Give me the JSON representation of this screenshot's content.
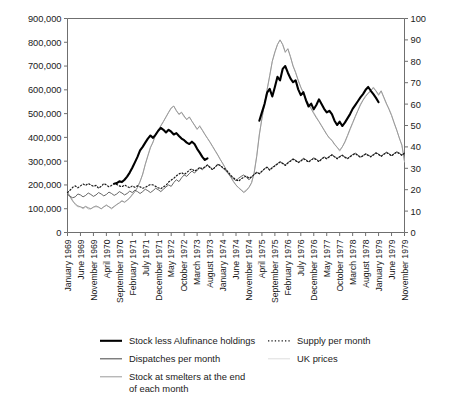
{
  "chart_data": {
    "type": "line",
    "title": "",
    "subtitle": "",
    "xlabel": "",
    "ylabel": "",
    "y2label": "",
    "grid": false,
    "legend_position": "bottom",
    "ylim": [
      0,
      900000
    ],
    "y2lim": [
      0,
      100
    ],
    "y_ticks": [
      "0",
      "100,000",
      "200,000",
      "300,000",
      "400,000",
      "500,000",
      "600,000",
      "700,000",
      "800,000",
      "900,000"
    ],
    "y_tick_values": [
      0,
      100000,
      200000,
      300000,
      400000,
      500000,
      600000,
      700000,
      800000,
      900000
    ],
    "y2_ticks": [
      "0",
      "10",
      "20",
      "30",
      "40",
      "50",
      "60",
      "70",
      "80",
      "90",
      "100"
    ],
    "y2_tick_values": [
      0,
      10,
      20,
      30,
      40,
      50,
      60,
      70,
      80,
      90,
      100
    ],
    "x_tick_labels": [
      "January 1969",
      "June 1969",
      "November 1969",
      "April 1970",
      "September 1970",
      "February 1971",
      "July 1971",
      "December 1971",
      "May 1972",
      "October 1972",
      "March 1973",
      "August 1973",
      "January 1974",
      "June 1974",
      "November 1974",
      "April 1975",
      "September 1975",
      "February 1976",
      "July 1976",
      "December 1976",
      "May 1977",
      "October 1977",
      "March 1978",
      "August 1978",
      "January 1979",
      "June 1979",
      "November 1979"
    ],
    "x_tick_month_index": [
      0,
      5,
      10,
      15,
      20,
      25,
      30,
      35,
      40,
      45,
      50,
      55,
      60,
      65,
      70,
      75,
      80,
      85,
      90,
      95,
      100,
      105,
      110,
      115,
      120,
      125,
      130
    ],
    "x_month_count": 131,
    "series": [
      {
        "name": "Stock less Alufinance holdings",
        "axis": "left",
        "color": "#000000",
        "width": 2.1,
        "dash": "none",
        "segments": [
          {
            "start_month": 18,
            "values": [
              205000,
              208000,
              215000,
              212000,
              222000,
              235000,
              252000,
              272000,
              295000,
              318000,
              345000,
              360000,
              378000,
              395000,
              408000,
              398000,
              412000,
              428000,
              440000,
              432000,
              421000,
              432000,
              424000,
              412000,
              418000,
              406000,
              395000,
              388000,
              378000,
              372000,
              382000,
              372000,
              352000,
              336000,
              318000,
              305000,
              312000
            ]
          },
          {
            "start_month": 74,
            "values": [
              470000,
              505000,
              540000,
              588000,
              604000,
              572000,
              612000,
              655000,
              640000,
              688000,
              700000,
              672000,
              648000,
              632000,
              640000,
              602000,
              578000,
              590000,
              556000,
              530000,
              542000,
              518000,
              536000,
              560000,
              540000,
              520000,
              505000,
              512000,
              498000,
              470000,
              452000,
              466000,
              448000,
              462000,
              480000,
              498000,
              520000,
              536000,
              552000,
              568000,
              582000,
              600000,
              612000,
              596000,
              582000,
              566000,
              548000
            ]
          }
        ]
      },
      {
        "name": "Supply per month",
        "axis": "left",
        "color": "#1a1a1a",
        "width": 1.2,
        "dash": "dotted",
        "values": [
          168000,
          178000,
          190000,
          196000,
          188000,
          196000,
          204000,
          198000,
          206000,
          200000,
          194000,
          198000,
          186000,
          194000,
          206000,
          200000,
          192000,
          198000,
          206000,
          202000,
          196000,
          192000,
          200000,
          194000,
          188000,
          196000,
          190000,
          196000,
          192000,
          186000,
          190000,
          196000,
          202000,
          200000,
          194000,
          188000,
          184000,
          192000,
          198000,
          212000,
          220000,
          228000,
          238000,
          246000,
          252000,
          244000,
          252000,
          262000,
          268000,
          258000,
          264000,
          274000,
          268000,
          276000,
          284000,
          272000,
          264000,
          276000,
          286000,
          282000,
          272000,
          266000,
          254000,
          240000,
          230000,
          222000,
          216000,
          226000,
          232000,
          238000,
          228000,
          234000,
          244000,
          252000,
          248000,
          258000,
          268000,
          274000,
          262000,
          272000,
          280000,
          288000,
          296000,
          290000,
          282000,
          292000,
          300000,
          308000,
          302000,
          294000,
          300000,
          310000,
          304000,
          296000,
          304000,
          312000,
          306000,
          298000,
          308000,
          316000,
          310000,
          318000,
          326000,
          318000,
          310000,
          318000,
          324000,
          316000,
          310000,
          318000,
          326000,
          332000,
          324000,
          316000,
          322000,
          330000,
          324000,
          318000,
          326000,
          334000,
          328000,
          320000,
          328000,
          336000,
          330000,
          322000,
          330000,
          338000,
          332000,
          324000,
          334000
        ],
        "axis_note": "dotted black"
      },
      {
        "name": "Dispatches per month",
        "axis": "left",
        "color": "#555555",
        "width": 0.9,
        "dash": "none",
        "values": [
          160000,
          152000,
          146000,
          150000,
          162000,
          158000,
          150000,
          156000,
          166000,
          160000,
          152000,
          158000,
          168000,
          162000,
          154000,
          160000,
          170000,
          164000,
          156000,
          162000,
          172000,
          166000,
          158000,
          164000,
          174000,
          168000,
          178000,
          172000,
          164000,
          172000,
          182000,
          176000,
          168000,
          176000,
          186000,
          180000,
          172000,
          182000,
          192000,
          200000,
          194000,
          210000,
          222000,
          214000,
          230000,
          242000,
          236000,
          248000,
          258000,
          250000,
          262000,
          272000,
          264000,
          274000,
          284000,
          276000,
          266000,
          276000,
          288000,
          280000,
          270000,
          260000,
          248000,
          236000,
          226000,
          218000,
          228000,
          236000,
          242000,
          232000,
          222000,
          232000,
          244000,
          254000,
          246000,
          256000,
          268000,
          276000,
          264000,
          274000,
          282000,
          290000,
          298000,
          292000,
          284000,
          294000,
          302000,
          310000,
          304000,
          296000,
          302000,
          312000,
          306000,
          298000,
          306000,
          314000,
          308000,
          300000,
          310000,
          318000,
          312000,
          320000,
          328000,
          320000,
          312000,
          320000,
          326000,
          318000,
          312000,
          320000,
          328000,
          334000,
          326000,
          318000,
          324000,
          332000,
          326000,
          320000,
          328000,
          336000,
          330000,
          322000,
          330000,
          338000,
          332000,
          324000,
          332000,
          340000,
          334000,
          326000,
          336000
        ],
        "axis_note": "thin grey"
      },
      {
        "name": "Stock at smelters at the end of each month",
        "axis": "left",
        "color": "#9a9a9a",
        "width": 1.0,
        "dash": "none",
        "values": [
          168000,
          150000,
          132000,
          120000,
          112000,
          108000,
          104000,
          110000,
          104000,
          100000,
          106000,
          112000,
          106000,
          100000,
          108000,
          114000,
          108000,
          102000,
          110000,
          118000,
          124000,
          132000,
          128000,
          136000,
          146000,
          158000,
          172000,
          190000,
          214000,
          246000,
          286000,
          322000,
          356000,
          382000,
          410000,
          428000,
          448000,
          466000,
          486000,
          506000,
          524000,
          532000,
          512000,
          498000,
          506000,
          490000,
          474000,
          486000,
          468000,
          452000,
          436000,
          446000,
          430000,
          412000,
          396000,
          380000,
          362000,
          344000,
          326000,
          306000,
          288000,
          268000,
          250000,
          232000,
          214000,
          200000,
          188000,
          178000,
          168000,
          176000,
          190000,
          210000,
          250000,
          320000,
          410000,
          480000,
          540000,
          600000,
          660000,
          720000,
          760000,
          790000,
          810000,
          790000,
          760000,
          772000,
          740000,
          700000,
          672000,
          640000,
          610000,
          588000,
          562000,
          540000,
          520000,
          500000,
          482000,
          466000,
          448000,
          430000,
          412000,
          398000,
          388000,
          372000,
          358000,
          346000,
          360000,
          382000,
          408000,
          436000,
          462000,
          488000,
          512000,
          536000,
          556000,
          572000,
          586000,
          598000,
          608000,
          596000,
          580000,
          596000,
          570000,
          544000,
          518000,
          492000,
          462000,
          430000,
          398000,
          366000,
          300000
        ],
        "axis_note": "light grey"
      },
      {
        "name": "UK prices",
        "axis": "right",
        "color": "#c2c2c2",
        "width": 1.0,
        "dash": "none",
        "values": [
          19,
          17,
          15,
          13,
          12,
          12,
          11,
          12,
          11,
          11,
          12,
          12,
          12,
          11,
          12,
          13,
          12,
          11,
          12,
          13,
          14,
          15,
          14,
          15,
          16,
          18,
          19,
          21,
          24,
          27,
          32,
          36,
          40,
          42,
          46,
          48,
          50,
          52,
          54,
          56,
          58,
          59,
          57,
          55,
          56,
          54,
          53,
          54,
          52,
          50,
          48,
          50,
          48,
          46,
          44,
          42,
          40,
          38,
          36,
          34,
          32,
          30,
          28,
          26,
          24,
          22,
          21,
          20,
          19,
          20,
          21,
          23,
          28,
          36,
          46,
          53,
          60,
          67,
          73,
          80,
          84,
          88,
          90,
          88,
          84,
          86,
          82,
          78,
          75,
          71,
          68,
          65,
          62,
          60,
          58,
          56,
          54,
          52,
          50,
          48,
          46,
          44,
          43,
          41,
          40,
          38,
          40,
          42,
          45,
          48,
          51,
          54,
          57,
          60,
          62,
          64,
          65,
          66,
          68,
          66,
          64,
          66,
          63,
          60,
          58,
          55,
          51,
          48,
          44,
          41,
          33
        ],
        "axis_note": "very light grey, right axis"
      }
    ]
  },
  "legend": {
    "items": [
      {
        "label": "Stock less Alufinance holdings",
        "style": "solid",
        "color": "#000000",
        "width": 2.1,
        "col": 1,
        "row": 1
      },
      {
        "label": "Supply per month",
        "style": "dotted",
        "color": "#1a1a1a",
        "width": 1.2,
        "col": 2,
        "row": 1
      },
      {
        "label": "Dispatches per month",
        "style": "solid",
        "color": "#555555",
        "width": 1.1,
        "col": 1,
        "row": 2
      },
      {
        "label": "UK prices",
        "style": "solid",
        "color": "#dddddd",
        "width": 1.0,
        "col": 2,
        "row": 2
      },
      {
        "label": "Stock at smelters at the end",
        "label_line2": "of each month",
        "style": "solid",
        "color": "#9a9a9a",
        "width": 1.0,
        "col": 1,
        "row": 3
      }
    ]
  },
  "colors": {
    "axis": "#6f6f6f",
    "text": "#1a1a1a",
    "background": "#ffffff"
  }
}
